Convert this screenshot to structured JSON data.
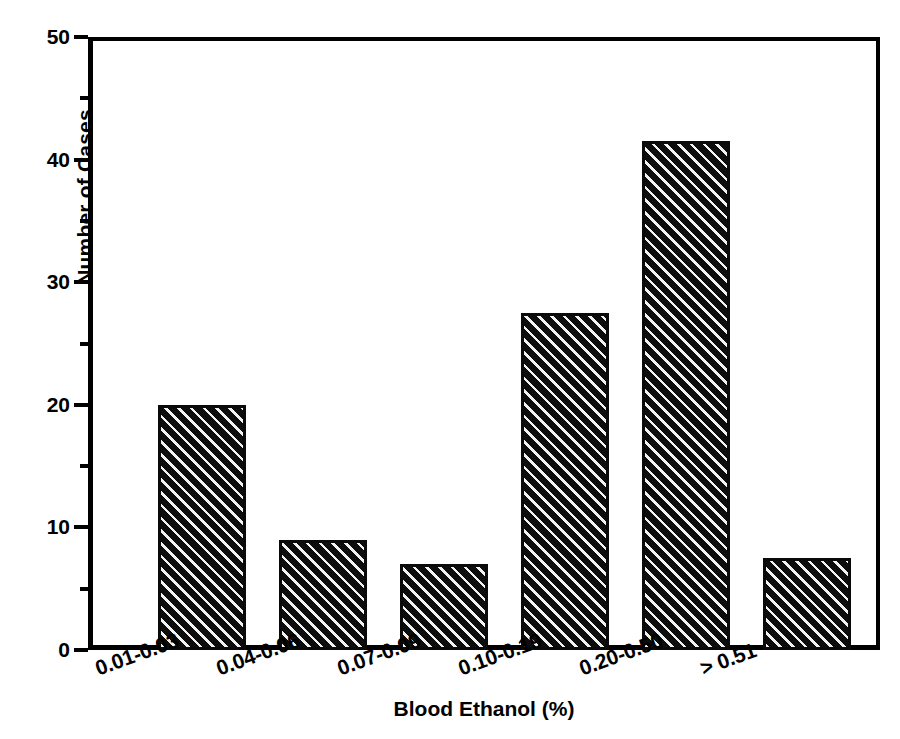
{
  "chart_data": {
    "type": "bar",
    "title": "",
    "subtitle": "",
    "xlabel": "Blood Ethanol (%)",
    "ylabel": "Number of Cases",
    "categories": [
      "0.01-0.03",
      "0.04-0.06",
      "0.07-0.09",
      "0.10-0.19",
      "0.20-0.50",
      "> 0.51"
    ],
    "values": [
      20,
      9,
      7,
      27.5,
      41.5,
      7.5
    ],
    "ylim": [
      0,
      50
    ],
    "xlim_categories": 6,
    "y_major_ticks": [
      0,
      10,
      20,
      30,
      40,
      50
    ],
    "y_minor_ticks": [
      5,
      15,
      25,
      35,
      45
    ],
    "y_tick_labels": [
      "0",
      "10",
      "20",
      "30",
      "40",
      "50"
    ],
    "grid": false,
    "legend": null,
    "legend_position": "none",
    "bar_fill": "diagonal-hatch",
    "bar_edge_color": "#000000",
    "axis_color": "#000000",
    "background_color": "#ffffff",
    "x_tick_label_rotation_deg": -20,
    "annotations": []
  },
  "axes": {
    "y_title": "Number of Cases",
    "x_title": "Blood Ethanol (%)",
    "y_labels": [
      {
        "value": 0,
        "text": "0"
      },
      {
        "value": 10,
        "text": "10"
      },
      {
        "value": 20,
        "text": "20"
      },
      {
        "value": 30,
        "text": "30"
      },
      {
        "value": 40,
        "text": "40"
      },
      {
        "value": 50,
        "text": "50"
      }
    ],
    "x_labels": [
      {
        "text": "0.01-0.03"
      },
      {
        "text": "0.04-0.06"
      },
      {
        "text": "0.07-0.09"
      },
      {
        "text": "0.10-0.19"
      },
      {
        "text": "0.20-0.50"
      },
      {
        "text": "> 0.51"
      }
    ]
  }
}
